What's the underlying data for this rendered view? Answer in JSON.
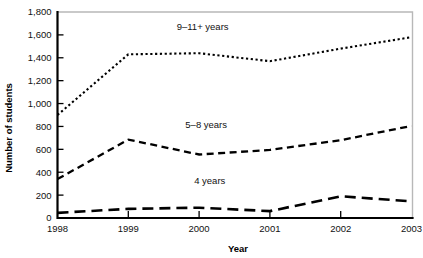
{
  "chart_data": {
    "type": "line",
    "title": "",
    "xlabel": "Year",
    "ylabel": "Number of students",
    "x": [
      1998,
      1999,
      2000,
      2001,
      2002,
      2003
    ],
    "xtick_labels": [
      "1998",
      "1999",
      "2000",
      "2001",
      "2002",
      "2003"
    ],
    "ytick_labels": [
      "0",
      "200",
      "400",
      "600",
      "800",
      "1,000",
      "1,200",
      "1,400",
      "1,600",
      "1,800"
    ],
    "ytick_values": [
      0,
      200,
      400,
      600,
      800,
      1000,
      1200,
      1400,
      1600,
      1800
    ],
    "ylim": [
      0,
      1800
    ],
    "xlim": [
      1998,
      2003
    ],
    "grid": false,
    "legend_position": "inline-annotations",
    "series": [
      {
        "name": "9–11+ years",
        "label": "9–11+ years",
        "dash": "dotted",
        "color": "#000000",
        "values": [
          900,
          1430,
          1440,
          1370,
          1480,
          1580
        ]
      },
      {
        "name": "5–8 years",
        "label": "5–8 years",
        "dash": "dashed",
        "color": "#000000",
        "values": [
          340,
          685,
          555,
          595,
          680,
          805
        ]
      },
      {
        "name": "4 years",
        "label": "4 years",
        "dash": "long-dashed",
        "color": "#000000",
        "values": [
          45,
          80,
          90,
          60,
          190,
          145
        ]
      }
    ],
    "annotations": [
      {
        "text": "9–11+ years",
        "x": 2000.05,
        "y": 1640
      },
      {
        "text": "5–8 years",
        "x": 2000.1,
        "y": 790
      },
      {
        "text": "4 years",
        "x": 2000.15,
        "y": 295
      }
    ],
    "axis_color": "#000000",
    "frame_color": "#b8b8b8",
    "background": "#ffffff"
  }
}
